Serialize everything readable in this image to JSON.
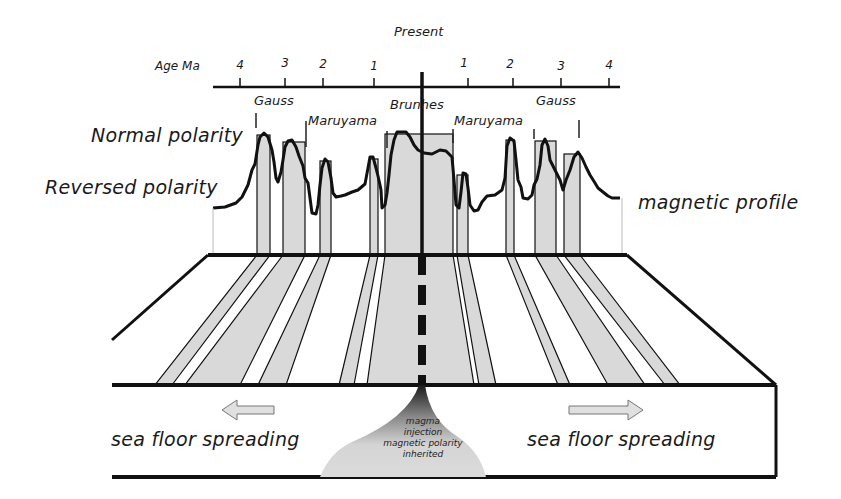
{
  "title_present": "Present",
  "axis": {
    "label": "Age Ma",
    "left_ticks": [
      {
        "label": "4",
        "x": 240
      },
      {
        "label": "3",
        "x": 285
      },
      {
        "label": "2",
        "x": 323
      },
      {
        "label": "1",
        "x": 374
      }
    ],
    "right_ticks": [
      {
        "label": "1",
        "x": 468
      },
      {
        "label": "2",
        "x": 513
      },
      {
        "label": "3",
        "x": 561
      },
      {
        "label": "4",
        "x": 609
      }
    ]
  },
  "epochs": {
    "gauss_left": "Gauss",
    "maruyama_left": "Maruyama",
    "brunhes": "Brunhes",
    "maruyama_right": "Maruyama",
    "gauss_right": "Gauss"
  },
  "labels": {
    "normal_polarity": "Normal polarity",
    "reversed_polarity": "Reversed polarity",
    "magnetic_profile": "magnetic profile",
    "spreading_left": "sea floor spreading",
    "spreading_right": "sea floor spreading",
    "magma_line1": "magma",
    "magma_line2": "injection",
    "magma_line3": "magnetic polarity",
    "magma_line4": "inherited"
  },
  "colors": {
    "stripe_fill": "#d9d9d9",
    "line": "#111111",
    "background": "#ffffff"
  },
  "stripes": [
    {
      "name": "gauss-left-1",
      "top": [
        257,
        270
      ],
      "bottom": [
        155,
        172
      ]
    },
    {
      "name": "gauss-left-2",
      "top": [
        283,
        305
      ],
      "bottom": [
        185,
        240
      ]
    },
    {
      "name": "gauss-left-3",
      "top": [
        320,
        331
      ],
      "bottom": [
        258,
        286
      ]
    },
    {
      "name": "matuyama-left-event",
      "top": [
        370,
        378
      ],
      "bottom": [
        339,
        354
      ]
    },
    {
      "name": "brunhes",
      "top": [
        385,
        453
      ],
      "bottom": [
        367,
        474
      ]
    },
    {
      "name": "matuyama-right-event",
      "top": [
        457,
        468
      ],
      "bottom": [
        479,
        496
      ]
    },
    {
      "name": "gauss-right-1",
      "top": [
        506,
        514
      ],
      "bottom": [
        558,
        570
      ]
    },
    {
      "name": "gauss-right-2",
      "top": [
        535,
        556
      ],
      "bottom": [
        608,
        645
      ]
    },
    {
      "name": "gauss-right-3",
      "top": [
        564,
        580
      ],
      "bottom": [
        665,
        680
      ]
    }
  ]
}
